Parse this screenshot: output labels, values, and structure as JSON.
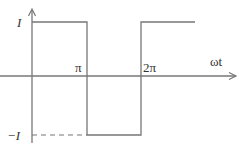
{
  "diagram": {
    "type": "square-wave",
    "labels": {
      "y_high": "I",
      "y_low": "−I",
      "x_pi": "π",
      "x_2pi": "2π",
      "x_axis": "ωt"
    },
    "colors": {
      "line": "#777777",
      "text": "#333333"
    },
    "levels": {
      "high": 1,
      "low": -1
    },
    "segments": [
      {
        "from": "0",
        "to": "π",
        "value": 1
      },
      {
        "from": "π",
        "to": "2π",
        "value": -1
      },
      {
        "from": "2π",
        "to": "3π",
        "value": 1
      }
    ]
  }
}
